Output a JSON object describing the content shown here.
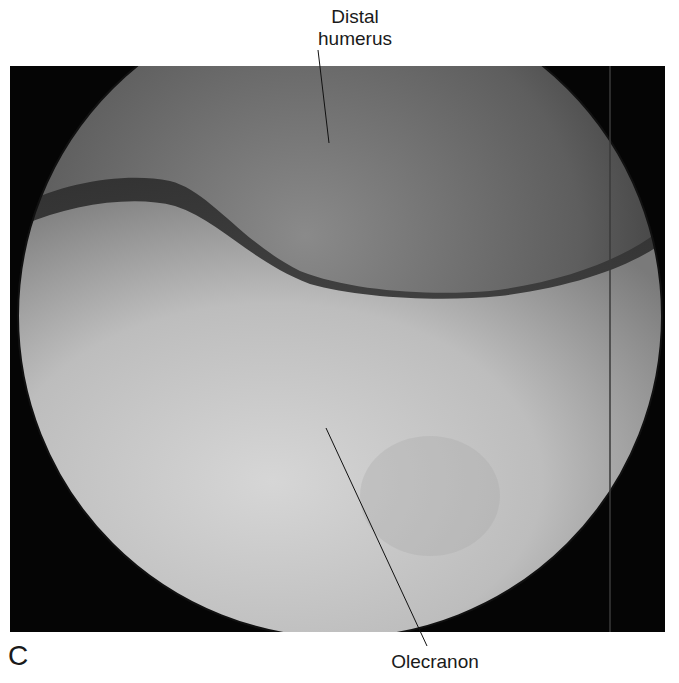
{
  "figure": {
    "panel_letter": "C",
    "image_description": "Arthroscopic view of elbow joint (circular scope field)",
    "labels": [
      {
        "id": "distal-humerus",
        "line1": "Distal",
        "line2": "humerus"
      },
      {
        "id": "olecranon",
        "text": "Olecranon"
      }
    ],
    "colors": {
      "background": "#ffffff",
      "scope_border": "#050505",
      "humerus_tone": "#6e6e6e",
      "olecranon_tone": "#c4c4c4",
      "label_text": "#1a1a1a"
    }
  }
}
